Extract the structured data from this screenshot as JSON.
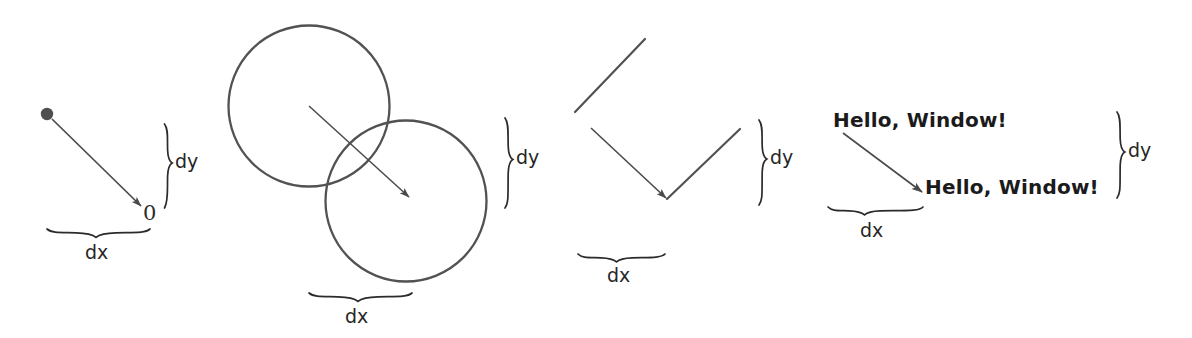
{
  "figure": {
    "title": "",
    "background_color": "#ffffff",
    "stroke_color": "#4a4a4a",
    "text_color": "#262626",
    "width": 1192,
    "height": 338
  },
  "panels": [
    {
      "id": "point",
      "name": "point-panel",
      "dy_label": "dy",
      "dx_label": "dx",
      "origin_label": "0",
      "shape": "dot"
    },
    {
      "id": "circles",
      "name": "circles-panel",
      "dy_label": "dy",
      "dx_label": "dx",
      "shape": "circle"
    },
    {
      "id": "lines",
      "name": "lines-panel",
      "dy_label": "dy",
      "dx_label": "dx",
      "shape": "line-segments"
    },
    {
      "id": "text",
      "name": "text-panel",
      "dy_label": "dy",
      "dx_label": "dx",
      "shape": "text",
      "text_source": "Hello, Window!",
      "text_target": "Hello, Window!"
    }
  ],
  "labels": {
    "p1_dy": "dy",
    "p1_dx": "dx",
    "p1_zero": "0",
    "p2_dy": "dy",
    "p2_dx": "dx",
    "p3_dy": "dy",
    "p3_dx": "dx",
    "p4_dy": "dy",
    "p4_dx": "dx",
    "greeting_top": "Hello, Window!",
    "greeting_bottom": "Hello, Window!"
  }
}
